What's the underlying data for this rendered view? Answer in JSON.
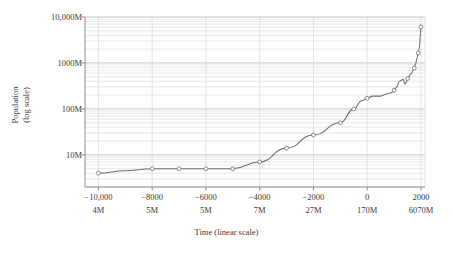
{
  "figure": {
    "background": "#ffffff",
    "line_color": "#6e6e6e",
    "grid_major_color": "#b9b9b9",
    "grid_minor_color": "#d8d8d8",
    "axis_color": "#8c8c8c",
    "marker_fill": "#ffffff",
    "marker_stroke": "#6e6e6e"
  },
  "chart_data": {
    "type": "line",
    "title": "",
    "xlabel": "Time (linear scale)",
    "ylabel": "Population\n(log scale)",
    "ylabel_line1": "Population",
    "ylabel_line2": "(log scale)",
    "xscale": "linear",
    "yscale": "log",
    "xlim": [
      -10500,
      2150
    ],
    "ylim": [
      2000000,
      10000000000
    ],
    "grid": true,
    "grid_minor": true,
    "legend": "none",
    "y_ticks": [
      {
        "value": 10000000000,
        "label": "10,000M"
      },
      {
        "value": 1000000000,
        "label": "1000M"
      },
      {
        "value": 100000000,
        "label": "100M"
      },
      {
        "value": 10000000,
        "label": "10M"
      }
    ],
    "x_ticks": [
      {
        "value": -10000,
        "label": "−10,000",
        "label2": "4M"
      },
      {
        "value": -8000,
        "label": "−8000",
        "label2": "5M"
      },
      {
        "value": -6000,
        "label": "−6000",
        "label2": "5M"
      },
      {
        "value": -4000,
        "label": "−4000",
        "label2": "7M"
      },
      {
        "value": -2000,
        "label": "−2000",
        "label2": "27M"
      },
      {
        "value": 0,
        "label": "0",
        "label2": "170M"
      },
      {
        "value": 2000,
        "label": "2000",
        "label2": "6070M"
      }
    ],
    "x": [
      -10000,
      -9000,
      -8000,
      -7000,
      -6000,
      -5000,
      -4000,
      -3000,
      -2000,
      -1000,
      -500,
      -200,
      0,
      200,
      400,
      500,
      600,
      700,
      800,
      900,
      1000,
      1100,
      1200,
      1250,
      1300,
      1340,
      1400,
      1450,
      1500,
      1550,
      1600,
      1650,
      1700,
      1750,
      1800,
      1850,
      1900,
      1927,
      1950,
      1960,
      1970,
      1980,
      1990,
      2000,
      2010
    ],
    "y": [
      4000000,
      4500000,
      5000000,
      5000000,
      5000000,
      5000000,
      7000000,
      14000000,
      27000000,
      50000000,
      100000000,
      150000000,
      170000000,
      190000000,
      190000000,
      190000000,
      200000000,
      210000000,
      220000000,
      226000000,
      254000000,
      301000000,
      400000000,
      416000000,
      432000000,
      442000000,
      350000000,
      374000000,
      458000000,
      500000000,
      556000000,
      603000000,
      679000000,
      770000000,
      954000000,
      1241000000,
      1654000000,
      2000000000,
      2519000000,
      3018000000,
      3682000000,
      4440000000,
      5310000000,
      6070000000,
      6900000000
    ],
    "markers": [
      {
        "x": -10000,
        "y": 4000000
      },
      {
        "x": -8000,
        "y": 5000000
      },
      {
        "x": -7000,
        "y": 5000000
      },
      {
        "x": -6000,
        "y": 5000000
      },
      {
        "x": -5000,
        "y": 5000000
      },
      {
        "x": -4000,
        "y": 7000000
      },
      {
        "x": -3000,
        "y": 14000000
      },
      {
        "x": -2000,
        "y": 27000000
      },
      {
        "x": -1000,
        "y": 50000000
      },
      {
        "x": -500,
        "y": 100000000
      },
      {
        "x": 0,
        "y": 170000000
      },
      {
        "x": 1000,
        "y": 254000000
      },
      {
        "x": 1500,
        "y": 458000000
      },
      {
        "x": 1750,
        "y": 770000000
      },
      {
        "x": 1900,
        "y": 1654000000
      },
      {
        "x": 2000,
        "y": 6070000000
      }
    ]
  }
}
